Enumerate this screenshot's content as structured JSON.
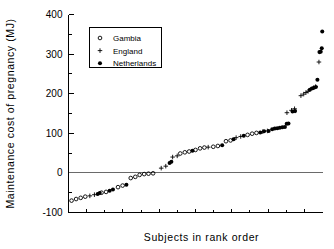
{
  "chart_data": {
    "type": "scatter",
    "title": "",
    "xlabel": "Subjects in rank order",
    "ylabel": "Maintenance cost of pregnancy (MJ)",
    "ylim": [
      -100,
      400
    ],
    "yticks": [
      -100,
      0,
      100,
      200,
      300,
      400
    ],
    "ytick_labels": [
      "-100",
      "0",
      "100",
      "200",
      "300",
      "400"
    ],
    "yminor_ticks": [
      -50,
      50,
      150,
      250,
      350
    ],
    "xlim": [
      0,
      100
    ],
    "xticks_unlabeled": true,
    "grid": false,
    "zero_reference_line": 0,
    "legend_position": "upper left",
    "series": [
      {
        "name": "Gambia",
        "marker": "open-circle",
        "points": [
          [
            1.2,
            -70
          ],
          [
            3.0,
            -66
          ],
          [
            4.8,
            -63
          ],
          [
            6.6,
            -60
          ],
          [
            13.0,
            -50
          ],
          [
            14.8,
            -48
          ],
          [
            19.5,
            -36
          ],
          [
            21.3,
            -32
          ],
          [
            24.5,
            -13
          ],
          [
            26.3,
            -10
          ],
          [
            28.0,
            -5
          ],
          [
            29.8,
            -3
          ],
          [
            31.5,
            -2
          ],
          [
            33.3,
            -1
          ],
          [
            44.0,
            49
          ],
          [
            45.8,
            52
          ],
          [
            47.5,
            54
          ],
          [
            50.0,
            58
          ],
          [
            51.8,
            62
          ],
          [
            53.5,
            64
          ],
          [
            57.0,
            66
          ],
          [
            58.8,
            68
          ],
          [
            62.0,
            80
          ],
          [
            63.8,
            82
          ],
          [
            70.5,
            96
          ],
          [
            72.3,
            99
          ],
          [
            74.0,
            101
          ]
        ]
      },
      {
        "name": "England",
        "marker": "plus",
        "points": [
          [
            8.4,
            -58
          ],
          [
            10.2,
            -55
          ],
          [
            36.5,
            12
          ],
          [
            38.3,
            17
          ],
          [
            41.0,
            40
          ],
          [
            42.8,
            43
          ],
          [
            55.0,
            65
          ],
          [
            66.0,
            89
          ],
          [
            67.8,
            92
          ],
          [
            76.5,
            104
          ],
          [
            78.3,
            106
          ],
          [
            86.0,
            152
          ],
          [
            87.8,
            158
          ],
          [
            89.0,
            162
          ],
          [
            91.5,
            195
          ],
          [
            92.6,
            199
          ],
          [
            93.5,
            203
          ],
          [
            94.3,
            206
          ],
          [
            96.5,
            215
          ],
          [
            97.3,
            218
          ],
          [
            98.6,
            280
          ]
        ]
      },
      {
        "name": "Netherlands",
        "marker": "filled-circle",
        "points": [
          [
            11.5,
            -53
          ],
          [
            12.3,
            -51
          ],
          [
            16.2,
            -45
          ],
          [
            17.5,
            -42
          ],
          [
            22.8,
            -30
          ],
          [
            39.8,
            25
          ],
          [
            40.5,
            28
          ],
          [
            48.8,
            56
          ],
          [
            60.5,
            70
          ],
          [
            65.0,
            85
          ],
          [
            69.0,
            94
          ],
          [
            75.5,
            102
          ],
          [
            77.0,
            105
          ],
          [
            78.8,
            106
          ],
          [
            80.2,
            110
          ],
          [
            81.2,
            112
          ],
          [
            82.2,
            113
          ],
          [
            83.2,
            114
          ],
          [
            84.2,
            115
          ],
          [
            85.2,
            116
          ],
          [
            85.9,
            124
          ],
          [
            86.6,
            125
          ],
          [
            88.2,
            155
          ],
          [
            89.2,
            156
          ],
          [
            95.0,
            210
          ],
          [
            95.8,
            213
          ],
          [
            96.6,
            215
          ],
          [
            97.4,
            217
          ],
          [
            98.0,
            235
          ],
          [
            98.8,
            305
          ],
          [
            99.3,
            306
          ],
          [
            99.7,
            315
          ],
          [
            99.9,
            357
          ]
        ]
      }
    ]
  },
  "legend": {
    "entries": [
      {
        "label": "Gambia",
        "marker": "open-circle"
      },
      {
        "label": "England",
        "marker": "plus"
      },
      {
        "label": "Netherlands",
        "marker": "filled-circle"
      }
    ]
  },
  "colors": {
    "foreground": "#000000",
    "background": "#ffffff",
    "zero_line": "#6a6a6a"
  }
}
